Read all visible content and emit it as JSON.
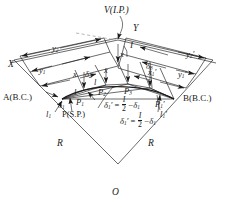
{
  "figure": {
    "kind": "simple-circular-curve-deflection-angle-layout",
    "colors": {
      "ink": "#1a1a1a",
      "paper": "#ffffff",
      "dashed": "#9a9a9a"
    }
  },
  "labels": {
    "vertex": "V(I.P.)",
    "y_axis": "Y",
    "x_axis": "X",
    "intersection_angle": "I",
    "bc_left": "A(B.C.)",
    "ec_right": "B(B.C.)",
    "mid_point": "P(S.P.)",
    "center": "O",
    "radius_left": "R",
    "radius_right": "R"
  },
  "stations": {
    "p1": "P",
    "p1_sub": "1",
    "p2": "P",
    "p2_sub": "2",
    "p3": "P",
    "p3_sub": "3",
    "p1p": "P",
    "p1p_sub": "1",
    "p1p_prime": "′"
  },
  "chords": {
    "c0": "l",
    "c0_sub": "1",
    "c1": "l",
    "c2": "l",
    "c3": "l",
    "c4": "l",
    "c5": "l",
    "c5_sub": "1",
    "c5_prime": "′"
  },
  "deflections": {
    "d1": "δ",
    "d1_sub": "1",
    "d2": "δ",
    "d2_sub": "2",
    "d3": "δ",
    "d3_sub": "3",
    "d1p": "δ",
    "d1p_sub": "1",
    "d1p_prime": "′"
  },
  "offsets": {
    "x_left": "x",
    "x_mid": "x",
    "x_right": "x",
    "x_prime": "x",
    "x_prime_sub": "1",
    "x_prime_mark": "′",
    "y1": "y",
    "y1_sub": "1",
    "y2": "y",
    "y2_sub": "2",
    "y1_prime": "y",
    "y1_prime_sub": "1",
    "y1_prime_mark": "′",
    "y2_prime": "y",
    "y2_prime_sub": "2",
    "y2_prime_mark": "′"
  },
  "equations": {
    "upper": {
      "lhs_sym": "δ",
      "lhs_sub": "1",
      "lhs_prime": "′",
      "eq": "=",
      "num": "I",
      "den": "2",
      "minus": "−",
      "rhs_sym": "δ",
      "rhs_sub": "1"
    },
    "lower": {
      "lhs_sym": "δ",
      "lhs_sub": "1",
      "lhs_prime": "′",
      "eq": "=",
      "num": "I",
      "den": "2",
      "minus": "−",
      "rhs_sym": "δ",
      "rhs_sub": "1"
    }
  }
}
